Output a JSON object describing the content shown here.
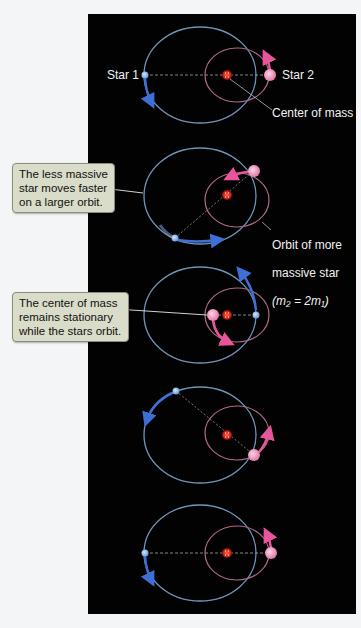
{
  "figure": {
    "background": "#020203",
    "colors": {
      "big_orbit": "#6f95b8",
      "small_orbit": "#b06a86",
      "star1": "#8fb6e6",
      "star2": "#f0a6c6",
      "center_of_mass": "#e8291c",
      "motion_arrow_blue": "#3d6fd6",
      "motion_arrow_pink": "#e8559a",
      "callout_bg": "#d9dcc8"
    },
    "labels": {
      "star1": "Star 1",
      "star2": "Star 2",
      "center_of_mass": "Center of mass",
      "orbit_massive_line1": "Orbit of more",
      "orbit_massive_line2": "massive star",
      "orbit_massive_formula": "(m₂ = 2m₁)"
    },
    "callouts": [
      {
        "text": "The less massive\nstar moves faster\non a larger orbit."
      },
      {
        "text": "The center of mass\nremains stationary\nwhile the stars orbit."
      }
    ],
    "panels": [
      {
        "index": 1,
        "phase": "star1 left, star2 right"
      },
      {
        "index": 2,
        "phase": "star1 lower-left, star2 upper-right"
      },
      {
        "index": 3,
        "phase": "star1 right, star2 left"
      },
      {
        "index": 4,
        "phase": "star1 upper-left, star2 lower-right"
      },
      {
        "index": 5,
        "phase": "star1 left, star2 right"
      }
    ],
    "mass_ratio": "m2 = 2m1"
  }
}
